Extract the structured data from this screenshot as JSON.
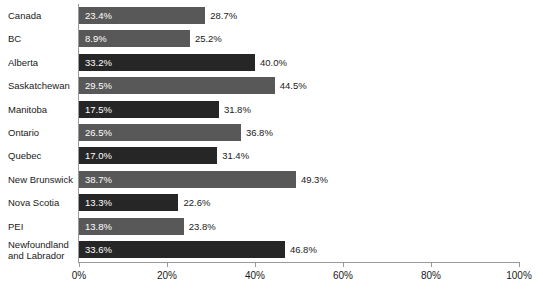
{
  "chart_data": {
    "type": "bar",
    "orientation": "horizontal",
    "title": "",
    "xlabel": "",
    "ylabel": "",
    "xlim": [
      0,
      100
    ],
    "xticks": [
      "0%",
      "20%",
      "40%",
      "60%",
      "80%",
      "100%"
    ],
    "xtick_values": [
      0,
      20,
      40,
      60,
      80,
      100
    ],
    "grid": false,
    "legend": "none",
    "categories": [
      "Canada",
      "BC",
      "Alberta",
      "Saskatchewan",
      "Manitoba",
      "Ontario",
      "Quebec",
      "New Brunswick",
      "Nova Scotia",
      "PEI",
      "Newfoundland and Labrador"
    ],
    "series": [
      {
        "name": "inner",
        "label_position": "inside",
        "values": [
          23.4,
          8.9,
          33.2,
          29.5,
          17.5,
          26.5,
          17.0,
          38.7,
          13.3,
          13.8,
          33.6
        ],
        "labels": [
          "23.4%",
          "8.9%",
          "33.2%",
          "29.5%",
          "17.5%",
          "26.5%",
          "17.0%",
          "38.7%",
          "13.3%",
          "13.8%",
          "33.6%"
        ]
      },
      {
        "name": "outer",
        "label_position": "end",
        "values": [
          28.7,
          25.2,
          40.0,
          44.5,
          31.8,
          36.8,
          31.4,
          49.3,
          22.6,
          23.8,
          46.8
        ],
        "labels": [
          "28.7%",
          "25.2%",
          "40.0%",
          "44.5%",
          "31.8%",
          "36.8%",
          "31.4%",
          "49.3%",
          "22.6%",
          "23.8%",
          "46.8%"
        ]
      }
    ],
    "bar_shades": [
      "light",
      "light",
      "dark",
      "light",
      "dark",
      "light",
      "dark",
      "light",
      "dark",
      "light",
      "dark"
    ],
    "colors": {
      "bar_light": "#585858",
      "bar_dark": "#262626",
      "axis": "#9a9a9a",
      "text": "#1a1a1a",
      "inner_label_text": "#ffffff",
      "background": "#ffffff"
    }
  },
  "rows": [
    {
      "label": "Canada",
      "inner": "23.4%",
      "outer": "28.7%"
    },
    {
      "label": "BC",
      "inner": "8.9%",
      "outer": "25.2%"
    },
    {
      "label": "Alberta",
      "inner": "33.2%",
      "outer": "40.0%"
    },
    {
      "label": "Saskatchewan",
      "inner": "29.5%",
      "outer": "44.5%"
    },
    {
      "label": "Manitoba",
      "inner": "17.5%",
      "outer": "31.8%"
    },
    {
      "label": "Ontario",
      "inner": "26.5%",
      "outer": "36.8%"
    },
    {
      "label": "Quebec",
      "inner": "17.0%",
      "outer": "31.4%"
    },
    {
      "label": "New Brunswick",
      "inner": "38.7%",
      "outer": "49.3%"
    },
    {
      "label": "Nova Scotia",
      "inner": "13.3%",
      "outer": "22.6%"
    },
    {
      "label": "PEI",
      "inner": "13.8%",
      "outer": "23.8%"
    },
    {
      "label": "Newfoundland\nand Labrador",
      "inner": "33.6%",
      "outer": "46.8%"
    }
  ],
  "axis": {
    "ticks": [
      "0%",
      "20%",
      "40%",
      "60%",
      "80%",
      "100%"
    ]
  }
}
